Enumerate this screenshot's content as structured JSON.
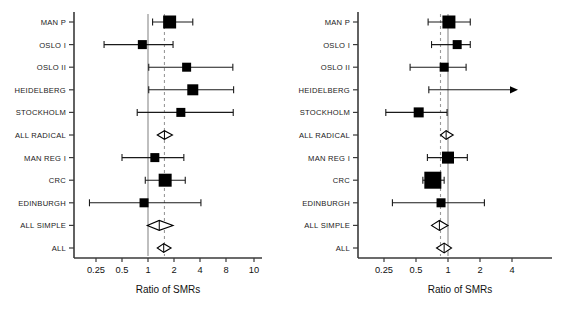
{
  "chart_data": [
    {
      "type": "forest",
      "panel_id": "left",
      "title": "",
      "xlabel": "Ratio of SMRs",
      "ylabel": "",
      "xscale": "log",
      "xlim": [
        0.18,
        10.5
      ],
      "ticks": [
        0.25,
        0.5,
        1,
        2,
        4,
        8,
        10
      ],
      "tick_labels": [
        "0.25",
        "0.5",
        "1",
        "2",
        "4",
        "8",
        "10"
      ],
      "grid": false,
      "legend": "none",
      "reference_line_solid": 1,
      "reference_line_dashed": 1.55,
      "categories": [
        "MAN P",
        "OSLO I",
        "OSLO II",
        "HEIDELBERG",
        "STOCKHOLM",
        "ALL RADICAL",
        "MAN REG I",
        "CRC",
        "EDINBURGH",
        "ALL SIMPLE",
        "ALL"
      ],
      "rows": [
        {
          "label": "MAN P",
          "marker": "square",
          "estimate": 1.78,
          "ci_low": 1.13,
          "ci_high": 3.3,
          "size": 13,
          "arrow_right": false
        },
        {
          "label": "OSLO I",
          "marker": "square",
          "estimate": 0.86,
          "ci_low": 0.31,
          "ci_high": 1.95,
          "size": 9,
          "arrow_right": false
        },
        {
          "label": "OSLO II",
          "marker": "square",
          "estimate": 2.8,
          "ci_low": 1.02,
          "ci_high": 9.6,
          "size": 9,
          "arrow_right": false
        },
        {
          "label": "HEIDELBERG",
          "marker": "square",
          "estimate": 3.3,
          "ci_low": 1.02,
          "ci_high": 9.8,
          "size": 11,
          "arrow_right": false
        },
        {
          "label": "STOCKHOLM",
          "marker": "square",
          "estimate": 2.4,
          "ci_low": 0.75,
          "ci_high": 9.7,
          "size": 9,
          "arrow_right": false
        },
        {
          "label": "ALL RADICAL",
          "marker": "diamond",
          "estimate": 1.55,
          "ci_low": 1.28,
          "ci_high": 1.92,
          "size": 7,
          "arrow_right": false
        },
        {
          "label": "MAN REG I",
          "marker": "square",
          "estimate": 1.2,
          "ci_low": 0.5,
          "ci_high": 2.6,
          "size": 9,
          "arrow_right": false
        },
        {
          "label": "CRC",
          "marker": "square",
          "estimate": 1.58,
          "ci_low": 0.93,
          "ci_high": 2.7,
          "size": 13,
          "arrow_right": false
        },
        {
          "label": "EDINBURGH",
          "marker": "square",
          "estimate": 0.9,
          "ci_low": 0.21,
          "ci_high": 4.1,
          "size": 9,
          "arrow_right": false
        },
        {
          "label": "ALL SIMPLE",
          "marker": "diamond",
          "estimate": 1.35,
          "ci_low": 0.98,
          "ci_high": 1.95,
          "size": 8,
          "arrow_right": false
        },
        {
          "label": "ALL",
          "marker": "diamond",
          "estimate": 1.52,
          "ci_low": 1.28,
          "ci_high": 1.85,
          "size": 7,
          "arrow_right": false
        }
      ]
    },
    {
      "type": "forest",
      "panel_id": "right",
      "title": "",
      "xlabel": "Ratio of SMRs",
      "ylabel": "",
      "xscale": "log",
      "xlim": [
        0.18,
        5.6
      ],
      "ticks": [
        0.25,
        0.5,
        1,
        2,
        4
      ],
      "tick_labels": [
        "0.25",
        "0.5",
        "1",
        "2",
        "4"
      ],
      "grid": false,
      "legend": "none",
      "reference_line_solid": 1,
      "reference_line_dashed": 0.85,
      "categories": [
        "MAN P",
        "OSLO I",
        "OSLO II",
        "HEIDELBERG",
        "STOCKHOLM",
        "ALL RADICAL",
        "MAN REG I",
        "CRC",
        "EDINBURGH",
        "ALL SIMPLE",
        "ALL"
      ],
      "rows": [
        {
          "label": "MAN P",
          "marker": "square",
          "estimate": 1.02,
          "ci_low": 0.65,
          "ci_high": 1.62,
          "size": 13,
          "arrow_right": false
        },
        {
          "label": "OSLO I",
          "marker": "square",
          "estimate": 1.22,
          "ci_low": 0.7,
          "ci_high": 1.62,
          "size": 9,
          "arrow_right": false
        },
        {
          "label": "OSLO II",
          "marker": "square",
          "estimate": 0.92,
          "ci_low": 0.44,
          "ci_high": 1.48,
          "size": 9,
          "arrow_right": false
        },
        {
          "label": "HEIDELBERG",
          "marker": "none",
          "estimate": null,
          "ci_low": 0.66,
          "ci_high": 5.2,
          "size": 0,
          "arrow_right": true
        },
        {
          "label": "STOCKHOLM",
          "marker": "square",
          "estimate": 0.53,
          "ci_low": 0.26,
          "ci_high": 0.98,
          "size": 10,
          "arrow_right": false
        },
        {
          "label": "ALL RADICAL",
          "marker": "diamond",
          "estimate": 0.96,
          "ci_low": 0.85,
          "ci_high": 1.12,
          "size": 7,
          "arrow_right": false
        },
        {
          "label": "MAN REG I",
          "marker": "square",
          "estimate": 1.0,
          "ci_low": 0.64,
          "ci_high": 1.52,
          "size": 12,
          "arrow_right": false
        },
        {
          "label": "CRC",
          "marker": "square",
          "estimate": 0.72,
          "ci_low": 0.58,
          "ci_high": 0.92,
          "size": 17,
          "arrow_right": false
        },
        {
          "label": "EDINBURGH",
          "marker": "square",
          "estimate": 0.86,
          "ci_low": 0.3,
          "ci_high": 2.2,
          "size": 9,
          "arrow_right": false
        },
        {
          "label": "ALL SIMPLE",
          "marker": "diamond",
          "estimate": 0.83,
          "ci_low": 0.7,
          "ci_high": 1.0,
          "size": 8,
          "arrow_right": false
        },
        {
          "label": "ALL",
          "marker": "diamond",
          "estimate": 0.92,
          "ci_low": 0.78,
          "ci_high": 1.08,
          "size": 8,
          "arrow_right": false
        }
      ]
    }
  ],
  "style": {
    "marker_color": "#000000",
    "line_color": "#1a1a1a",
    "axis_color": "#3a3a3a",
    "dashed_color": "#9a9a9a",
    "solid_ref_color": "#8a8a8a",
    "background": "#ffffff"
  },
  "layout": {
    "left_panel": {
      "axis_x": 74,
      "axis_top": 12,
      "axis_bottom": 258,
      "x_end": 262,
      "row_top": 22,
      "row_step": 22.6,
      "log_origin_px": 148,
      "px_per_doubling": 26,
      "tick_px": [
        96,
        122,
        148,
        174,
        200,
        226,
        254
      ]
    },
    "right_panel": {
      "axis_x": 358,
      "axis_top": 12,
      "axis_bottom": 258,
      "x_end": 552,
      "row_top": 22,
      "row_step": 22.6,
      "log_origin_px": 448,
      "px_per_doubling": 32,
      "tick_px": [
        384,
        416,
        448,
        480,
        512
      ]
    }
  }
}
